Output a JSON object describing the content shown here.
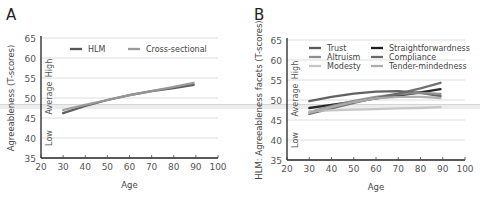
{
  "figure": {
    "panels": [
      "A",
      "B"
    ]
  },
  "chart_data": [
    {
      "panel": "A",
      "type": "line",
      "title": "",
      "xlabel": "Age",
      "ylabel": "Agreeableness (T-scores)",
      "xlim": [
        20,
        100
      ],
      "ylim": [
        35,
        65
      ],
      "xticks": [
        20,
        30,
        40,
        50,
        60,
        70,
        80,
        90,
        100
      ],
      "yticks": [
        35,
        40,
        45,
        50,
        55,
        60,
        65
      ],
      "grid": "horizontal",
      "band_labels": [
        "High",
        "Average",
        "Low"
      ],
      "legend_position": "top",
      "series": [
        {
          "name": "HLM",
          "color": "#555555",
          "x": [
            30,
            40,
            50,
            60,
            70,
            80,
            89
          ],
          "y": [
            46.2,
            48.0,
            49.5,
            50.7,
            51.7,
            52.5,
            53.3
          ]
        },
        {
          "name": "Cross-sectional",
          "color": "#999999",
          "x": [
            30,
            40,
            50,
            60,
            70,
            80,
            89
          ],
          "y": [
            47.0,
            48.3,
            49.5,
            50.7,
            51.7,
            52.8,
            53.8
          ]
        }
      ]
    },
    {
      "panel": "B",
      "type": "line",
      "title": "",
      "xlabel": "Age",
      "ylabel": "HLM: Agreeableness facets (T-scores)",
      "xlim": [
        20,
        100
      ],
      "ylim": [
        35,
        65
      ],
      "xticks": [
        20,
        30,
        40,
        50,
        60,
        70,
        80,
        90,
        100
      ],
      "yticks": [
        35,
        40,
        45,
        50,
        55,
        60,
        65
      ],
      "grid": "horizontal",
      "band_labels": [
        "High",
        "Average",
        "Low"
      ],
      "legend_position": "top",
      "series": [
        {
          "name": "Trust",
          "color": "#5a5a5a",
          "x": [
            30,
            40,
            50,
            60,
            70,
            80,
            89
          ],
          "y": [
            49.7,
            50.8,
            51.6,
            52.1,
            52.2,
            51.8,
            51.0
          ]
        },
        {
          "name": "Straightforwardness",
          "color": "#1e1e1e",
          "x": [
            30,
            40,
            50,
            60,
            70,
            80,
            89
          ],
          "y": [
            48.0,
            48.8,
            49.6,
            50.4,
            51.1,
            51.9,
            52.7
          ]
        },
        {
          "name": "Altruism",
          "color": "#8e8e8e",
          "x": [
            30,
            40,
            50,
            60,
            70,
            80,
            89
          ],
          "y": [
            47.0,
            48.5,
            49.8,
            50.8,
            51.5,
            51.8,
            51.5
          ]
        },
        {
          "name": "Compliance",
          "color": "#6a6a6a",
          "x": [
            30,
            40,
            50,
            60,
            70,
            80,
            89
          ],
          "y": [
            46.5,
            47.9,
            49.3,
            50.5,
            51.6,
            52.9,
            54.3
          ]
        },
        {
          "name": "Modesty",
          "color": "#c4c4c4",
          "x": [
            30,
            40,
            50,
            60,
            70,
            80,
            89
          ],
          "y": [
            47.2,
            47.4,
            47.6,
            47.7,
            47.9,
            48.0,
            48.2
          ]
        },
        {
          "name": "Tender-mindedness",
          "color": "#acacac",
          "x": [
            30,
            40,
            50,
            60,
            70,
            80,
            89
          ],
          "y": [
            46.8,
            48.2,
            49.5,
            50.4,
            50.8,
            50.8,
            50.5
          ]
        }
      ]
    }
  ]
}
